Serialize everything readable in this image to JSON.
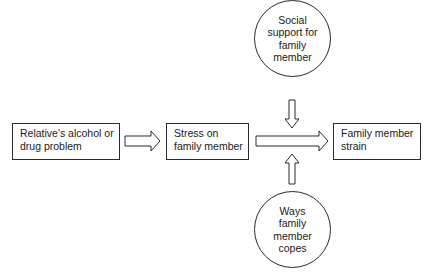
{
  "diagram": {
    "nodes": {
      "relative_problem": {
        "line1": "Relative's alcohol or",
        "line2": "drug problem"
      },
      "stress": {
        "line1": "Stress on",
        "line2": "family member"
      },
      "strain": {
        "line1": "Family member",
        "line2": "strain"
      },
      "social_support": {
        "text": "Social\nsupport for\nfamily\nmember"
      },
      "coping": {
        "text": "Ways\nfamily\nmember\ncopes"
      }
    },
    "edges": [
      {
        "from": "relative_problem",
        "to": "stress",
        "style": "hollow-arrow"
      },
      {
        "from": "stress",
        "to": "strain",
        "style": "hollow-arrow"
      },
      {
        "from": "social_support",
        "to": "stress-strain-link",
        "style": "hollow-arrow-down"
      },
      {
        "from": "coping",
        "to": "stress-strain-link",
        "style": "hollow-arrow-up"
      }
    ],
    "colors": {
      "stroke": "#2a2a2a",
      "fill": "#ffffff",
      "text": "#1a1a1a"
    }
  }
}
